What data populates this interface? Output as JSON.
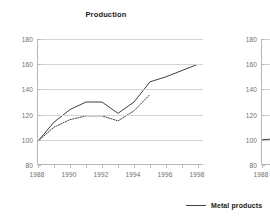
{
  "chart_data": [
    {
      "id": "production",
      "type": "line",
      "title": "Production",
      "xlabel": "",
      "ylabel": "",
      "xlim": [
        1988,
        1998
      ],
      "ylim": [
        80,
        180
      ],
      "grid": true,
      "x_ticks": [
        1988,
        1990,
        1992,
        1994,
        1996,
        1998
      ],
      "x_minor_ticks": [
        1989,
        1991,
        1993,
        1995,
        1997
      ],
      "y_ticks": [
        80,
        100,
        120,
        140,
        160,
        180
      ],
      "legend_position": "bottom-right",
      "series": [
        {
          "name": "Metal products",
          "style": "solid",
          "color": "#404040",
          "x": [
            1988,
            1989,
            1990,
            1991,
            1992,
            1993,
            1994,
            1995,
            1996,
            1997,
            1998
          ],
          "values": [
            99,
            114,
            124,
            130,
            130,
            121,
            130,
            146,
            150,
            155,
            160
          ]
        },
        {
          "name": "",
          "style": "dotted",
          "color": "#404040",
          "x": [
            1988,
            1989,
            1990,
            1991,
            1992,
            1993,
            1994,
            1995
          ],
          "values": [
            99,
            110,
            116,
            119,
            119,
            115,
            123,
            136
          ]
        }
      ]
    },
    {
      "id": "second-chart-clipped",
      "type": "line",
      "title": "",
      "xlabel": "",
      "ylabel": "",
      "xlim": [
        1988,
        1998
      ],
      "ylim": [
        80,
        180
      ],
      "grid": true,
      "x_ticks": [
        1988
      ],
      "x_minor_ticks": [],
      "y_ticks": [
        80,
        100,
        120,
        140,
        160,
        180
      ],
      "clipped": true,
      "series": [
        {
          "name": "",
          "style": "solid",
          "color": "#404040",
          "x": [
            1988,
            1989,
            1990
          ],
          "values": [
            100,
            101,
            104
          ]
        }
      ]
    }
  ],
  "legend": {
    "entries": [
      {
        "label": "Metal products",
        "style": "solid",
        "color": "#404040"
      }
    ]
  },
  "colors": {
    "line": "#404040",
    "gridline": "#d4d4d4",
    "axis": "#b8b8b8",
    "tick_text": "#6e6e6e",
    "title_text": "#1a1a1a",
    "background": "#ffffff"
  }
}
